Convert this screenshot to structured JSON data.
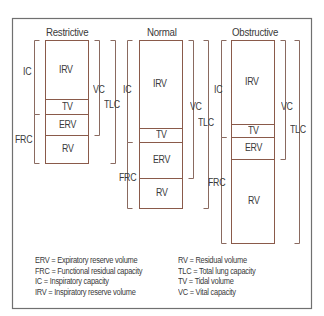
{
  "colors": {
    "frame": "#707070",
    "bar": "#8a5a4a",
    "bracket": "#8a6a60",
    "text": "#3a3a3a"
  },
  "frame": {
    "x": 12,
    "y": 18,
    "w": 299,
    "h": 290
  },
  "panels": [
    {
      "id": "restrictive",
      "title": "Restrictive",
      "title_x": 46,
      "title_y": 27,
      "bar": {
        "x": 45,
        "w": 43,
        "top": 40
      },
      "segments": [
        {
          "label": "IRV",
          "top": 40,
          "bottom": 99
        },
        {
          "label": "TV",
          "top": 99,
          "bottom": 114
        },
        {
          "label": "ERV",
          "top": 114,
          "bottom": 135
        },
        {
          "label": "RV",
          "top": 135,
          "bottom": 163
        }
      ],
      "brackets": [
        {
          "label": "IC",
          "side": "left",
          "x": 34,
          "top": 40,
          "bottom": 114,
          "lx": 23,
          "ly": 67
        },
        {
          "label": "FRC",
          "side": "left",
          "x": 34,
          "top": 114,
          "bottom": 163,
          "lx": 15,
          "ly": 135
        },
        {
          "label": "VC",
          "side": "right",
          "x": 99,
          "top": 40,
          "bottom": 135,
          "lx": 93,
          "ly": 85
        },
        {
          "label": "TLC",
          "side": "right",
          "x": 115,
          "top": 40,
          "bottom": 163,
          "lx": 104,
          "ly": 100
        }
      ]
    },
    {
      "id": "normal",
      "title": "Normal",
      "title_x": 147,
      "title_y": 27,
      "bar": {
        "x": 139,
        "w": 43,
        "top": 40
      },
      "segments": [
        {
          "label": "IRV",
          "top": 40,
          "bottom": 128
        },
        {
          "label": "TV",
          "top": 128,
          "bottom": 142
        },
        {
          "label": "ERV",
          "top": 142,
          "bottom": 178
        },
        {
          "label": "RV",
          "top": 178,
          "bottom": 208
        }
      ],
      "brackets": [
        {
          "label": "IC",
          "side": "left",
          "x": 127,
          "top": 40,
          "bottom": 142,
          "lx": 123,
          "ly": 85
        },
        {
          "label": "FRC",
          "side": "left",
          "x": 127,
          "top": 142,
          "bottom": 208,
          "lx": 119,
          "ly": 173
        },
        {
          "label": "VC",
          "side": "right",
          "x": 193,
          "top": 40,
          "bottom": 178,
          "lx": 190,
          "ly": 102
        },
        {
          "label": "TLC",
          "side": "right",
          "x": 208,
          "top": 40,
          "bottom": 208,
          "lx": 198,
          "ly": 118
        }
      ]
    },
    {
      "id": "obstructive",
      "title": "Obstructive",
      "title_x": 232,
      "title_y": 27,
      "bar": {
        "x": 231,
        "w": 43,
        "top": 40
      },
      "segments": [
        {
          "label": "IRV",
          "top": 40,
          "bottom": 124
        },
        {
          "label": "TV",
          "top": 124,
          "bottom": 137
        },
        {
          "label": "ERV",
          "top": 137,
          "bottom": 159
        },
        {
          "label": "RV",
          "top": 159,
          "bottom": 243
        }
      ],
      "brackets": [
        {
          "label": "IC",
          "side": "left",
          "x": 221,
          "top": 40,
          "bottom": 137,
          "lx": 214,
          "ly": 85
        },
        {
          "label": "FRC",
          "side": "left",
          "x": 221,
          "top": 137,
          "bottom": 243,
          "lx": 208,
          "ly": 178
        },
        {
          "label": "VC",
          "side": "right",
          "x": 285,
          "top": 40,
          "bottom": 159,
          "lx": 281,
          "ly": 102
        },
        {
          "label": "TLC",
          "side": "right",
          "x": 299,
          "top": 40,
          "bottom": 243,
          "lx": 290,
          "ly": 125
        }
      ]
    }
  ],
  "legend": {
    "left": [
      "ERV = Expiratory reserve volume",
      "FRC = Functional residual capacity",
      "IC = Inspiratory capacity",
      "IRV = Inspiratory reserve volume"
    ],
    "right": [
      "RV = Residual volume",
      "TLC = Total lung capacity",
      "TV = Tidal volume",
      "VC = Vital capacity"
    ]
  }
}
